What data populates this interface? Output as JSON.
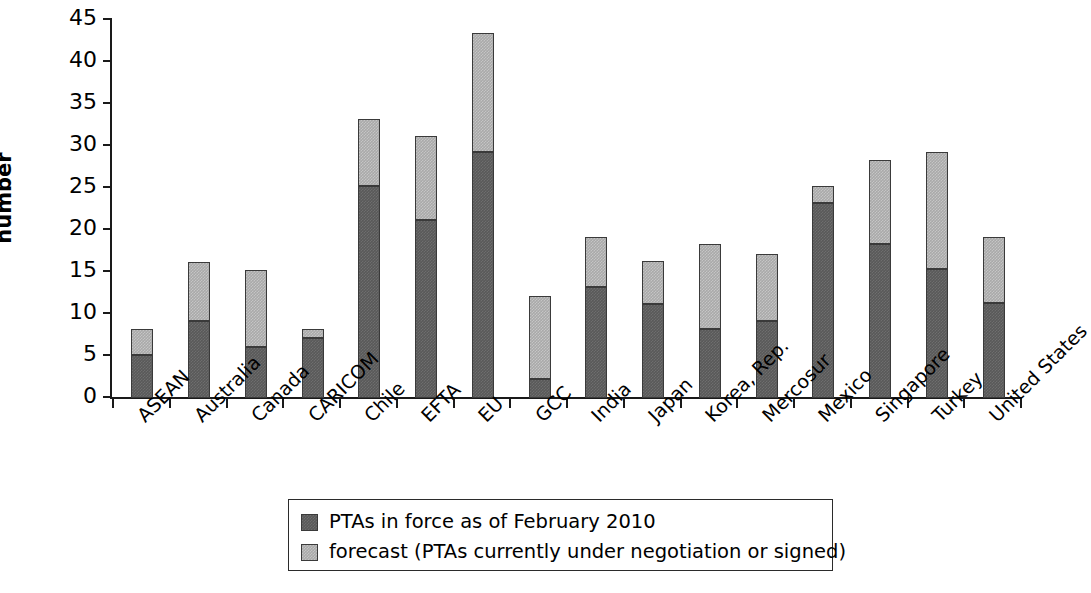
{
  "chart_data": {
    "type": "bar",
    "subtype": "stacked-vertical",
    "title": "",
    "xlabel": "",
    "ylabel": "number",
    "ylim": [
      0,
      45
    ],
    "yticks": [
      0,
      5,
      10,
      15,
      20,
      25,
      30,
      35,
      40,
      45
    ],
    "grid": false,
    "legend_position": "bottom-center",
    "categories": [
      "ASEAN",
      "Australia",
      "Canada",
      "CARICOM",
      "Chile",
      "EFTA",
      "EU",
      "GCC",
      "India",
      "Japan",
      "Korea, Rep.",
      "Mercosur",
      "Mexico",
      "Singapore",
      "Turkey",
      "United States"
    ],
    "series": [
      {
        "name": "PTAs in force as of February 2010",
        "color": "#595959",
        "values": [
          5.1,
          9.2,
          6.1,
          7.2,
          25.2,
          21.2,
          29.3,
          2.3,
          13.2,
          11.2,
          8.2,
          9.2,
          23.2,
          18.3,
          15.3,
          11.3
        ]
      },
      {
        "name": "forecast (PTAs currently under negotiation or signed)",
        "color": "#a9a9a9",
        "values": [
          3.1,
          7.0,
          9.1,
          1.0,
          8.0,
          10.0,
          14.1,
          9.9,
          6.0,
          5.1,
          10.1,
          8.0,
          2.1,
          10.0,
          14.0,
          7.9
        ]
      }
    ],
    "totals": [
      8.2,
      16.2,
      15.2,
      8.2,
      33.2,
      31.2,
      43.4,
      12.2,
      19.2,
      16.3,
      18.3,
      17.2,
      25.3,
      28.3,
      29.3,
      19.2
    ]
  },
  "legend": {
    "items": [
      {
        "label": "PTAs in force as of February 2010",
        "color": "#595959"
      },
      {
        "label": "forecast (PTAs currently under negotiation or signed)",
        "color": "#a9a9a9"
      }
    ]
  }
}
